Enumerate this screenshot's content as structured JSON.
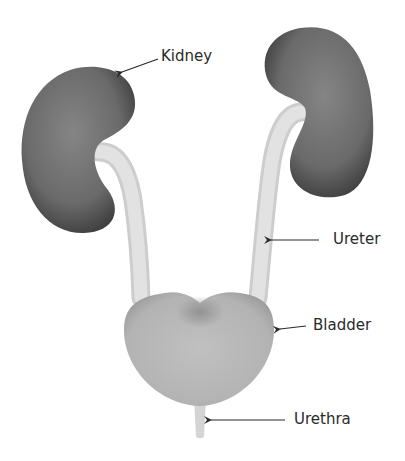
{
  "diagram": {
    "labels": {
      "kidney": "Kidney",
      "ureter": "Ureter",
      "bladder": "Bladder",
      "urethra": "Urethra"
    },
    "colors": {
      "background": "#ffffff",
      "kidney": "#6e6e6e",
      "kidney_dark": "#3c3c3c",
      "ureter": "#dedede",
      "bladder": "#b9b9b9",
      "bladder_shadow": "#8e8e8e",
      "urethra": "#d6d6d6",
      "label_text": "#2a2a2a",
      "arrow": "#2a2a2a"
    }
  }
}
